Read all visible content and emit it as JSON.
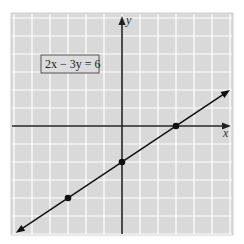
{
  "chart_data": {
    "type": "line",
    "title": "2x − 3y = 6",
    "xlabel": "x",
    "ylabel": "y",
    "xlim": [
      -6,
      6
    ],
    "ylim": [
      -6,
      6
    ],
    "grid": true,
    "series": [
      {
        "name": "2x − 3y = 6",
        "x": [
          -6,
          6
        ],
        "y": [
          -6,
          2
        ]
      }
    ],
    "points": [
      {
        "x": -3,
        "y": -4
      },
      {
        "x": 0,
        "y": -2
      },
      {
        "x": 3,
        "y": 0
      }
    ],
    "annotations": [
      "2x − 3y = 6"
    ]
  },
  "labels": {
    "equation": "2x − 3y = 6",
    "x_axis": "x",
    "y_axis": "y"
  },
  "colors": {
    "background": "#d9d9d9",
    "grid": "#ffffff",
    "axis": "#222222",
    "line": "#111111"
  }
}
